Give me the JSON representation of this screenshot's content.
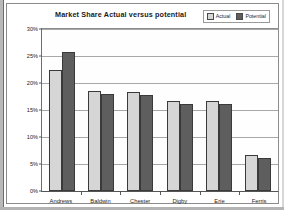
{
  "chart_data": {
    "type": "bar",
    "title": "Market Share Actual versus potential",
    "xlabel": "",
    "ylabel": "",
    "ylim": [
      0,
      30
    ],
    "ytick_labels": [
      "30%",
      "25%",
      "20%",
      "15%",
      "10%",
      "5%",
      "0%"
    ],
    "ytick_values": [
      30,
      25,
      20,
      15,
      10,
      5,
      0
    ],
    "grid": true,
    "legend_position": "top-right",
    "categories": [
      "Andrews",
      "Baldwin",
      "Chester",
      "Digby",
      "Erie",
      "Ferris"
    ],
    "series": [
      {
        "name": "Actual",
        "color": "#d6d6d6",
        "values": [
          22.5,
          18.5,
          18.4,
          16.6,
          16.6,
          6.6
        ]
      },
      {
        "name": "Potential",
        "color": "#5e5e5e",
        "values": [
          25.8,
          18.0,
          17.7,
          16.2,
          16.1,
          6.2
        ]
      }
    ]
  },
  "legend": {
    "items": [
      {
        "label": "Actual",
        "color": "#d6d6d6"
      },
      {
        "label": "Potential",
        "color": "#5e5e5e"
      }
    ]
  }
}
